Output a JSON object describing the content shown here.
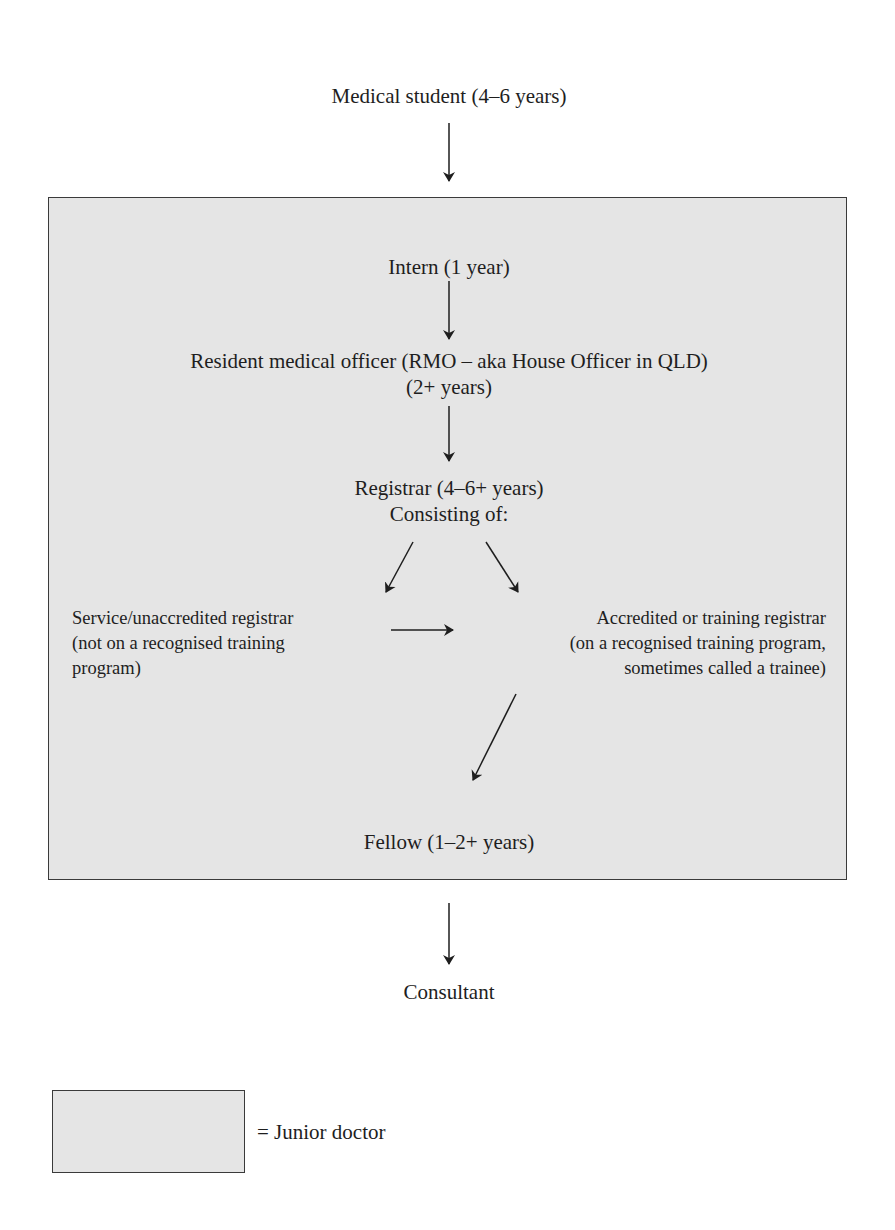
{
  "diagram": {
    "nodes": {
      "medical_student": "Medical student (4–6 years)",
      "intern": "Intern (1 year)",
      "rmo": {
        "line1": "Resident medical officer (RMO – aka House Officer in QLD)",
        "line2": "(2+ years)"
      },
      "registrar": {
        "line1": "Registrar (4–6+ years)",
        "line2": "Consisting of:"
      },
      "service_registrar": {
        "line1": "Service/unaccredited registrar",
        "line2": "(not on a recognised training",
        "line3": "program)"
      },
      "accredited_registrar": {
        "line1": "Accredited or training registrar",
        "line2": "(on a recognised training program,",
        "line3": "sometimes called a trainee)"
      },
      "fellow": "Fellow (1–2+ years)",
      "consultant": "Consultant"
    },
    "edges": [
      {
        "from": "medical_student",
        "to": "intern"
      },
      {
        "from": "intern",
        "to": "rmo"
      },
      {
        "from": "rmo",
        "to": "registrar"
      },
      {
        "from": "registrar",
        "to": "service_registrar"
      },
      {
        "from": "registrar",
        "to": "accredited_registrar"
      },
      {
        "from": "service_registrar",
        "to": "accredited_registrar"
      },
      {
        "from": "accredited_registrar",
        "to": "fellow"
      },
      {
        "from": "fellow",
        "to": "consultant"
      }
    ],
    "group": {
      "name": "Junior doctor",
      "members": [
        "intern",
        "rmo",
        "registrar",
        "service_registrar",
        "accredited_registrar",
        "fellow"
      ],
      "fill_color": "#e5e5e5",
      "border_color": "#3a3a3a"
    },
    "legend": {
      "label": "= Junior doctor"
    }
  }
}
